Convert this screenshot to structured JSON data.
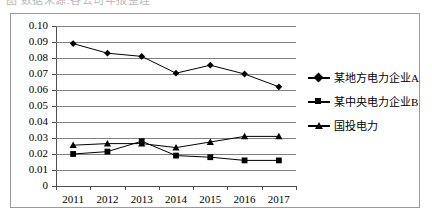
{
  "top_fragment": {
    "text": "图 数据来源:各公司年报整理"
  },
  "chart_data": {
    "type": "line",
    "title": "",
    "subtitle": "",
    "xlabel": "",
    "ylabel": "",
    "categories": [
      "2011",
      "2012",
      "2013",
      "2014",
      "2015",
      "2016",
      "2017"
    ],
    "ylim": [
      0,
      0.1
    ],
    "ytick_labels": [
      "0",
      "0.01",
      "0.02",
      "0.03",
      "0.04",
      "0.05",
      "0.06",
      "0.07",
      "0.08",
      "0.09",
      "0.10"
    ],
    "ytick_values": [
      0,
      0.01,
      0.02,
      0.03,
      0.04,
      0.05,
      0.06,
      0.07,
      0.08,
      0.09,
      0.1
    ],
    "grid": "horizontal",
    "legend_position": "right",
    "series": [
      {
        "name": "某地方电力企业A",
        "marker": "diamond",
        "color": "#000000",
        "values": [
          0.089,
          0.083,
          0.081,
          0.0705,
          0.0755,
          0.07,
          0.062
        ]
      },
      {
        "name": "某中央电力企业B",
        "marker": "square",
        "color": "#000000",
        "values": [
          0.02,
          0.0215,
          0.028,
          0.019,
          0.018,
          0.016,
          0.016
        ]
      },
      {
        "name": "国投电力",
        "marker": "triangle",
        "color": "#000000",
        "values": [
          0.0255,
          0.0265,
          0.0265,
          0.024,
          0.0275,
          0.031,
          0.031
        ]
      }
    ]
  }
}
